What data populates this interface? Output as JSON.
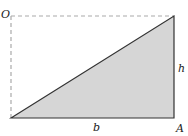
{
  "diagram": {
    "type": "right-triangle-in-rectangle",
    "colors": {
      "fill": "#d6d6d6",
      "stroke": "#333333",
      "dashed": "#aaaaaa",
      "label": "#222222"
    },
    "vertices": {
      "bottom_left": [
        11,
        118
      ],
      "top_right": [
        174,
        16
      ],
      "bottom_right": [
        174,
        118
      ],
      "top_left": [
        11,
        16
      ]
    },
    "labels": {
      "top_left_corner": "O",
      "bottom_right_corner": "A",
      "height": "h",
      "base": "b"
    }
  }
}
